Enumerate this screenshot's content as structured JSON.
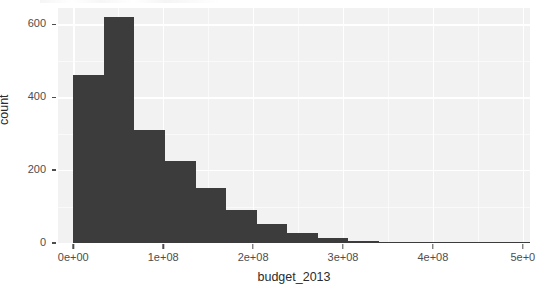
{
  "chart_data": {
    "type": "bar",
    "title": "",
    "xlabel": "budget_2013",
    "ylabel": "count",
    "xlim": [
      -17000000,
      508000000
    ],
    "ylim": [
      0,
      645
    ],
    "grid": true,
    "legend": null,
    "bin_width": 34000000,
    "x_tick_labels": [
      "0e+00",
      "1e+08",
      "2e+08",
      "3e+08",
      "4e+08",
      "5e+0"
    ],
    "x_tick_values": [
      0,
      100000000,
      200000000,
      300000000,
      400000000,
      500000000
    ],
    "y_tick_labels": [
      "0",
      "200",
      "400",
      "600"
    ],
    "y_tick_values": [
      0,
      200,
      400,
      600
    ],
    "bins": [
      {
        "x_start": 0,
        "x_end": 34000000,
        "count": 460
      },
      {
        "x_start": 34000000,
        "x_end": 68000000,
        "count": 620
      },
      {
        "x_start": 68000000,
        "x_end": 102000000,
        "count": 310
      },
      {
        "x_start": 102000000,
        "x_end": 136000000,
        "count": 225
      },
      {
        "x_start": 136000000,
        "x_end": 170000000,
        "count": 152
      },
      {
        "x_start": 170000000,
        "x_end": 204000000,
        "count": 90
      },
      {
        "x_start": 204000000,
        "x_end": 238000000,
        "count": 52
      },
      {
        "x_start": 238000000,
        "x_end": 272000000,
        "count": 28
      },
      {
        "x_start": 272000000,
        "x_end": 306000000,
        "count": 14
      },
      {
        "x_start": 306000000,
        "x_end": 340000000,
        "count": 5
      },
      {
        "x_start": 340000000,
        "x_end": 374000000,
        "count": 3
      },
      {
        "x_start": 374000000,
        "x_end": 408000000,
        "count": 2
      },
      {
        "x_start": 408000000,
        "x_end": 442000000,
        "count": 1
      },
      {
        "x_start": 442000000,
        "x_end": 476000000,
        "count": 1
      },
      {
        "x_start": 476000000,
        "x_end": 510000000,
        "count": 2
      }
    ],
    "colors": {
      "bar_fill": "#3c3c3c",
      "panel_background": "#f2f2f2",
      "gridline": "#ffffff",
      "axis_text": "#4d4d4d",
      "axis_title": "#2b2b2b"
    }
  }
}
